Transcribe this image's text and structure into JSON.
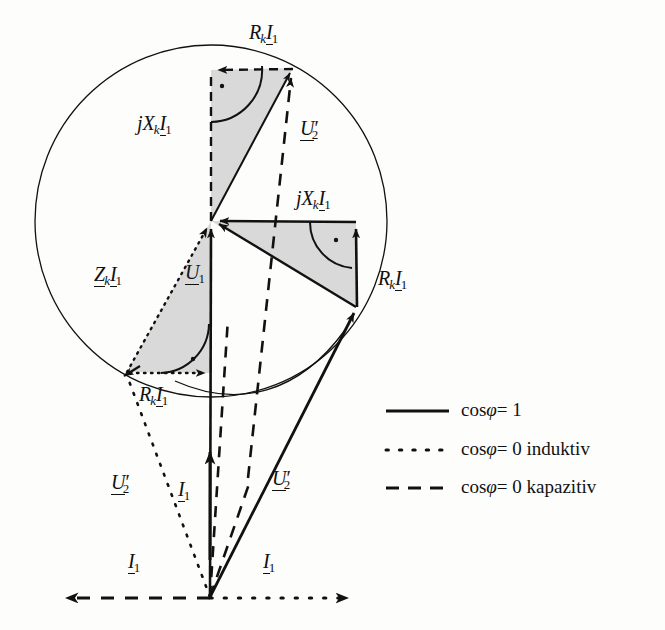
{
  "figure": {
    "kind": "phasor-diagram",
    "background_color": "#fdfdfc",
    "stroke_color": "#111111",
    "fill_color": "#d9d9d9",
    "circle": {
      "cx": 211,
      "cy": 221,
      "r": 176
    }
  },
  "labels": {
    "rk_i1_top": "R_k I_1",
    "jxk_i1_left": "jX_k I_1",
    "u2_prime_top": "U'_2",
    "jxk_i1_right": "jX_k I_1",
    "rk_i1_right": "R_k I_1",
    "zk_i1_left": "Z_k I_1",
    "u1_center": "U_1",
    "rk_i1_bottom": "R_k I_1",
    "u2_prime_left": "U'_2",
    "i1_mid_left": "I_1",
    "u2_prime_right": "U'_2",
    "i1_bottom_left": "I_1",
    "i1_bottom_right": "I_1"
  },
  "label_parts": {
    "R": "R",
    "X": "X",
    "Z": "Z",
    "U": "U",
    "I": "I",
    "j": "j",
    "k": "k",
    "one": "1",
    "two": "2",
    "prime": "′"
  },
  "legend": {
    "rows": [
      {
        "style": "solid",
        "label": "cosφ = 1",
        "cos": "cos",
        "phi": "φ",
        "eq": "= 1"
      },
      {
        "style": "dotted",
        "label": "cosφ = 0 induktiv",
        "cos": "cos",
        "phi": "φ",
        "eq": "= 0 induktiv"
      },
      {
        "style": "dashed",
        "label": "cosφ = 0 kapazitiv",
        "cos": "cos",
        "phi": "φ",
        "eq": "= 0 kapazitiv"
      }
    ]
  },
  "geometry": {
    "node": {
      "x": 211,
      "y": 221
    },
    "origin": {
      "x": 210,
      "y": 598
    },
    "top_triangle": {
      "apex_up": [
        211,
        70
      ],
      "apex_right": [
        293,
        68
      ]
    },
    "right_triangle": {
      "corner": [
        356,
        222
      ],
      "tip": [
        356,
        307
      ]
    },
    "left_triangle": {
      "corner": [
        127,
        372
      ],
      "foot": [
        211,
        373
      ]
    },
    "bottom_axis": {
      "left_tip": 58,
      "right_tip": 358,
      "y": 598
    }
  }
}
